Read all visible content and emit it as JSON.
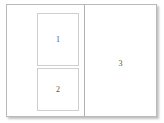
{
  "diagram": {
    "type": "page-layout-wireframe",
    "frame": {
      "background_color": "#ffffff",
      "border_color": "#b9b9b9",
      "shadow_color": "#787878"
    },
    "divider": {
      "orientation": "vertical",
      "color": "#b0b0b0"
    },
    "regions": [
      {
        "id": "region-1",
        "label": "1",
        "pane": "left",
        "border_color": "#cfcfcf",
        "background_color": "#ffffff"
      },
      {
        "id": "region-2",
        "label": "2",
        "pane": "left",
        "border_color": "#cfcfcf",
        "background_color": "#ffffff"
      },
      {
        "id": "region-3",
        "label": "3",
        "pane": "right",
        "border_color": "none",
        "background_color": "#ffffff"
      }
    ],
    "label_color": "#555555"
  }
}
